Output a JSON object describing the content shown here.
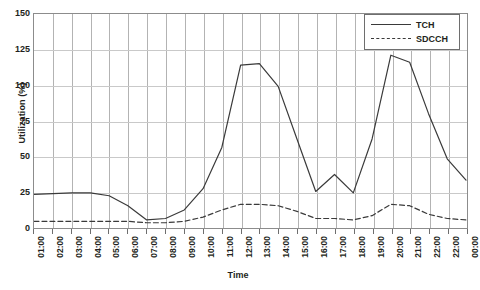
{
  "chart_data": {
    "type": "line",
    "title": "",
    "xlabel": "Time",
    "ylabel": "Utilization (%)",
    "ylim": [
      0,
      150
    ],
    "yticks": [
      0,
      25,
      50,
      75,
      100,
      125,
      150
    ],
    "grid": true,
    "legend_position": "top-right",
    "categories": [
      "01:00",
      "02:00",
      "03:00",
      "04:00",
      "05:00",
      "06:00",
      "07:00",
      "08:00",
      "09:00",
      "10:00",
      "11:00",
      "12:00",
      "13:00",
      "14:00",
      "15:00",
      "16:00",
      "17:00",
      "18:00",
      "19:00",
      "20:00",
      "21:00",
      "22:00",
      "22:00",
      "00:00"
    ],
    "series": [
      {
        "name": "TCH",
        "style": "solid",
        "color": "#3a3a3a",
        "values": [
          23,
          23.5,
          24,
          24,
          22,
          15,
          5,
          6,
          12,
          27,
          56,
          114,
          115,
          99,
          62,
          25,
          37,
          24,
          62,
          121,
          116,
          80,
          48,
          33
        ]
      },
      {
        "name": "SDCCH",
        "style": "dashed",
        "color": "#3a3a3a",
        "values": [
          4,
          4,
          4,
          4,
          4,
          4,
          3,
          3,
          4,
          7,
          12,
          16,
          16,
          15,
          11,
          6,
          6,
          5,
          8,
          16,
          15,
          9,
          6,
          5
        ]
      }
    ]
  },
  "legend": {
    "items": [
      {
        "label": "TCH",
        "style": "solid"
      },
      {
        "label": "SDCCH",
        "style": "dashed"
      }
    ]
  }
}
